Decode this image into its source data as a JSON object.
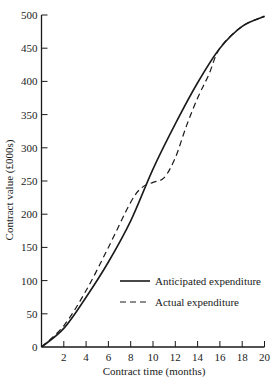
{
  "chart_data": {
    "type": "line",
    "title": "",
    "xlabel": "Contract time (months)",
    "ylabel": "Contract value (£000s)",
    "xlim": [
      0,
      20
    ],
    "ylim": [
      0,
      500
    ],
    "x_ticks": [
      2,
      4,
      6,
      8,
      10,
      12,
      14,
      16,
      18,
      20
    ],
    "y_ticks": [
      0,
      50,
      100,
      150,
      200,
      250,
      300,
      350,
      400,
      450,
      500
    ],
    "grid": false,
    "legend_position": "lower right (inside plot)",
    "series": [
      {
        "name": "Anticipated expenditure",
        "style": "solid",
        "x": [
          0,
          2,
          4,
          6,
          8,
          10,
          12,
          14,
          16,
          18,
          20
        ],
        "y": [
          0,
          28,
          75,
          128,
          190,
          268,
          336,
          398,
          450,
          483,
          498
        ]
      },
      {
        "name": "Actual expenditure",
        "style": "dashed",
        "x": [
          0,
          2,
          4,
          6,
          8,
          9,
          10,
          11,
          12,
          13,
          14,
          15,
          16,
          18,
          20
        ],
        "y": [
          0,
          32,
          85,
          150,
          218,
          240,
          248,
          255,
          285,
          333,
          375,
          410,
          450,
          483,
          498
        ]
      }
    ]
  },
  "axes": {
    "xlabel": "Contract time (months)",
    "ylabel": "Contract value (£000s)",
    "y_zero_label": "0"
  },
  "legend": {
    "items": [
      {
        "label": "Anticipated expenditure",
        "style": "solid"
      },
      {
        "label": "Actual expenditure",
        "style": "dashed"
      }
    ]
  },
  "colors": {
    "line": "#1a1a1a",
    "background": "#ffffff"
  }
}
